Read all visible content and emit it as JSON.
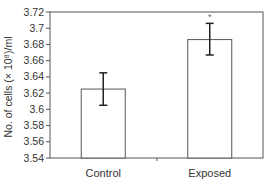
{
  "chart_data": {
    "type": "bar",
    "title": "",
    "xlabel": "",
    "ylabel": "No. of cells (× 10⁸)/ml",
    "categories": [
      "Control",
      "Exposed"
    ],
    "values": [
      3.625,
      3.686
    ],
    "error": [
      0.02,
      0.02
    ],
    "error_low": [
      3.605,
      3.667
    ],
    "error_high": [
      3.645,
      3.706
    ],
    "annotations": [
      {
        "category": "Exposed",
        "text": "*"
      }
    ],
    "ylim": [
      3.54,
      3.72
    ],
    "yticks": [
      "3.54",
      "3.56",
      "3.58",
      "3.6",
      "3.62",
      "3.64",
      "3.66",
      "3.68",
      "3.7",
      "3.72"
    ],
    "grid": false,
    "legend": null
  }
}
